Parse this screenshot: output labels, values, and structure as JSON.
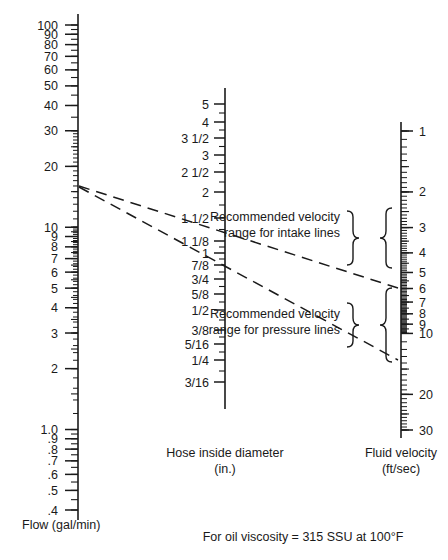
{
  "figure": {
    "type": "nomograph",
    "footnote": "For oil viscosity = 315 SSU at 100°F"
  },
  "scales": {
    "flow": {
      "axis_label_line1": "Flow (gal/min)",
      "units": "gal/min",
      "orientation": "logarithmic-descending",
      "range_top": 100,
      "range_bottom": 0.4,
      "labels": [
        "100",
        "90",
        "80",
        "70",
        "60",
        "50",
        "40",
        "30",
        "20",
        "10",
        "9",
        "8",
        "7",
        "6",
        "5",
        "4",
        "3",
        "2",
        "1.0",
        ".9",
        ".8",
        ".7",
        ".6",
        ".5",
        ".4"
      ],
      "values": [
        100,
        90,
        80,
        70,
        60,
        50,
        40,
        30,
        20,
        10,
        9,
        8,
        7,
        6,
        5,
        4,
        3,
        2,
        1.0,
        0.9,
        0.8,
        0.7,
        0.6,
        0.5,
        0.4
      ]
    },
    "diameter": {
      "axis_label_line1": "Hose inside diameter",
      "axis_label_line2": "(in.)",
      "units": "in.",
      "labels": [
        "5",
        "4",
        "3 1/2",
        "3",
        "2 1/2",
        "2",
        "1 1/2",
        "1 1/8",
        "1",
        "7/8",
        "3/4",
        "5/8",
        "1/2",
        "3/8",
        "5/16",
        "1/4",
        "3/16"
      ],
      "values": [
        5,
        4,
        3.5,
        3,
        2.5,
        2,
        1.5,
        1.125,
        1,
        0.875,
        0.75,
        0.625,
        0.5,
        0.375,
        0.3125,
        0.25,
        0.1875
      ]
    },
    "velocity": {
      "axis_label_line1": "Fluid velocity",
      "axis_label_line2": "(ft/sec)",
      "units": "ft/sec",
      "orientation": "logarithmic-descending",
      "range_top": 1,
      "range_bottom": 30,
      "labels": [
        "1",
        "2",
        "3",
        "4",
        "5",
        "6",
        "7",
        "8",
        "9",
        "10",
        "20",
        "30"
      ],
      "values": [
        1,
        2,
        3,
        4,
        5,
        6,
        7,
        8,
        9,
        10,
        20,
        30
      ]
    }
  },
  "annotations": {
    "intake": {
      "line1": "Recommended velocity",
      "line2": "range for intake lines",
      "velocity_from": 2,
      "velocity_to": 4
    },
    "pressure": {
      "line1": "Recommended velocity",
      "line2": "range for pressure lines",
      "velocity_from": 7,
      "velocity_to": 20
    }
  },
  "index_lines": [
    {
      "name": "intake-example",
      "flow": 20,
      "diameter": "1 1/8",
      "velocity": 6.6
    },
    {
      "name": "pressure-example",
      "flow": 20,
      "diameter": "3/4",
      "velocity": 15
    }
  ],
  "chart_data": {
    "type": "line",
    "title": "",
    "xlabel": "",
    "ylabel": "",
    "series": [
      {
        "name": "Flow (gal/min)",
        "values": [
          100,
          90,
          80,
          70,
          60,
          50,
          40,
          30,
          20,
          10,
          9,
          8,
          7,
          6,
          5,
          4,
          3,
          2,
          1.0,
          0.9,
          0.8,
          0.7,
          0.6,
          0.5,
          0.4
        ]
      },
      {
        "name": "Hose inside diameter (in.)",
        "values": [
          5,
          4,
          3.5,
          3,
          2.5,
          2,
          1.5,
          1.125,
          1,
          0.875,
          0.75,
          0.625,
          0.5,
          0.375,
          0.3125,
          0.25,
          0.1875
        ]
      },
      {
        "name": "Fluid velocity (ft/sec)",
        "values": [
          1,
          2,
          3,
          4,
          5,
          6,
          7,
          8,
          9,
          10,
          20,
          30
        ]
      }
    ]
  }
}
